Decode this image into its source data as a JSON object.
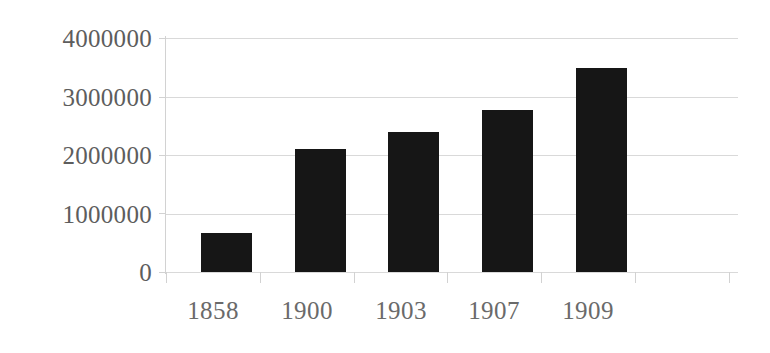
{
  "chart_data": {
    "type": "bar",
    "title": "",
    "subtitle": "",
    "xlabel": "",
    "ylabel": "",
    "categories": [
      "1858",
      "1900",
      "1903",
      "1907",
      "1909"
    ],
    "values": [
      660000,
      2100000,
      2390000,
      2770000,
      3490000
    ],
    "series": [
      {
        "name": "",
        "values": [
          660000,
          2100000,
          2390000,
          2770000,
          3490000
        ]
      }
    ],
    "ylim": [
      0,
      4000000
    ],
    "ytick_labels": [
      "0",
      "1000000",
      "2000000",
      "3000000",
      "4000000"
    ],
    "ytick_values": [
      0,
      1000000,
      2000000,
      3000000,
      4000000
    ],
    "xtick_labels": [
      "1858",
      "1900",
      "1903",
      "1907",
      "1909"
    ],
    "grid": true,
    "grid_axis": "y",
    "legend": false,
    "legend_position": "none",
    "annotations": [],
    "data_labels": false,
    "colors": {
      "bar": "#161616",
      "gridline": "#d9d9d9",
      "axis_line": "#d2d2d2",
      "tick_label": "#5d5d5d",
      "category_label": "#6a6a6a",
      "background": "#ffffff"
    }
  }
}
